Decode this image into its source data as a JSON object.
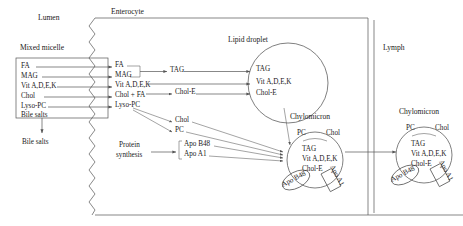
{
  "diagram": {
    "compartments": {
      "lumen": "Lumen",
      "enterocyte": "Enterocyte",
      "lymph": "Lymph"
    },
    "micelle": {
      "title": "Mixed micelle",
      "items": [
        "FA",
        "MAG",
        "Vit A,D,E,K",
        "Chol",
        "Lyso-PC",
        "Bile salts"
      ]
    },
    "bile_salts_out": "Bile salts",
    "enterocyte_uptake": [
      "FA",
      "MAG",
      "Vit A,D,E,K",
      "Chol + FA",
      "Lyso-PC"
    ],
    "intermediates": {
      "tag": "TAG",
      "chol_e": "Chol-E",
      "chol": "Chol",
      "pc": "PC"
    },
    "protein_synthesis": {
      "label_line1": "Protein",
      "label_line2": "synthesis",
      "apos": [
        "Apo B48",
        "Apo A1"
      ]
    },
    "lipid_droplet": {
      "title": "Lipid droplet",
      "contents": [
        "TAG",
        "Vit A,D,E,K",
        "Chol-E"
      ]
    },
    "chylomicron_cell": {
      "title": "Chylomicron",
      "surface": [
        "PC",
        "Chol"
      ],
      "core": [
        "TAG",
        "Vit A,D,E,K",
        "Chol-E"
      ],
      "apo_b48": "Apo B48",
      "apo_a1": "Apo A1"
    },
    "chylomicron_lymph": {
      "title": "Chylomicron",
      "surface": [
        "PC",
        "Chol"
      ],
      "core": [
        "TAG",
        "Vit A,D,E,K",
        "Chol-E"
      ],
      "apo_b48": "Apo B48",
      "apo_a1": "Apo A1"
    },
    "colors": {
      "line": "#555555",
      "text": "#1a1a1a",
      "background": "#ffffff"
    }
  }
}
